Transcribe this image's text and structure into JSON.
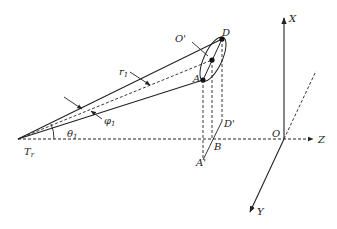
{
  "diagram": {
    "type": "3D geometry / coordinate system sketch",
    "colors": {
      "line": "#222222",
      "background": "#ffffff"
    },
    "axes": {
      "x_label": "X",
      "y_label": "Y",
      "z_label": "Z",
      "origin_label": "O"
    },
    "points": {
      "transmitter": {
        "label": "T",
        "subscript": "r"
      },
      "D": "D",
      "O_prime": "O'",
      "A": "A",
      "D_prime": "D'",
      "B": "B",
      "A_prime": "A'"
    },
    "annotations": {
      "range": {
        "label": "r",
        "subscript": "1"
      },
      "azimuth": {
        "label": "φ",
        "subscript": "1"
      },
      "elevation": {
        "label": "θ",
        "subscript": "1"
      }
    }
  }
}
